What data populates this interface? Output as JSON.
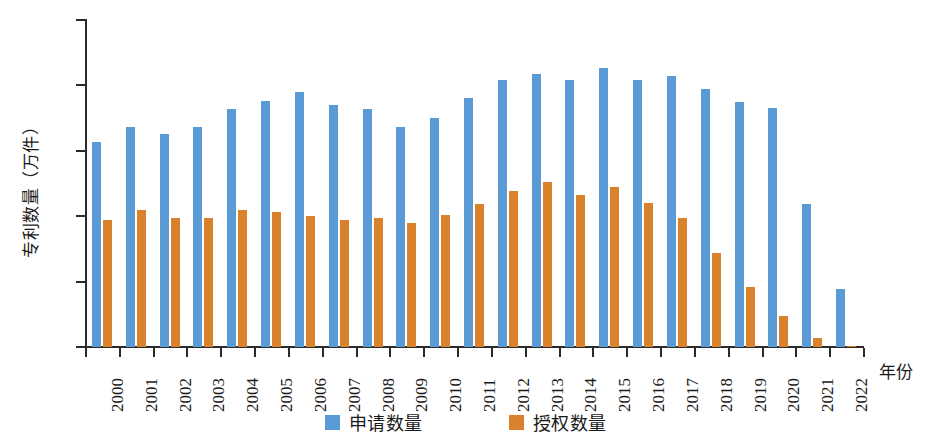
{
  "chart_data": {
    "type": "bar",
    "title": "",
    "xlabel": "年份",
    "ylabel": "专利数量（万件）",
    "categories": [
      "2000",
      "2001",
      "2002",
      "2003",
      "2004",
      "2005",
      "2006",
      "2007",
      "2008",
      "2009",
      "2010",
      "2011",
      "2012",
      "2013",
      "2014",
      "2015",
      "2016",
      "2017",
      "2018",
      "2019",
      "2020",
      "2021",
      "2022"
    ],
    "series": [
      {
        "name": "申请数量",
        "color": "#5b9bd5",
        "values": [
          1.57,
          1.68,
          1.63,
          1.68,
          1.82,
          1.88,
          1.95,
          1.85,
          1.82,
          1.68,
          1.75,
          1.9,
          2.04,
          2.09,
          2.04,
          2.13,
          2.04,
          2.07,
          1.97,
          1.87,
          1.83,
          1.09,
          0.44
        ]
      },
      {
        "name": "授权数量",
        "color": "#d9822b",
        "values": [
          0.97,
          1.05,
          0.99,
          0.99,
          1.05,
          1.03,
          1.0,
          0.97,
          0.99,
          0.95,
          1.01,
          1.09,
          1.19,
          1.26,
          1.16,
          1.22,
          1.1,
          0.99,
          0.72,
          0.46,
          0.24,
          0.07,
          0.01
        ]
      }
    ],
    "ylim": [
      0,
      2.5
    ],
    "yticks": [
      0,
      0.5,
      1.0,
      1.5,
      2.0,
      2.5
    ],
    "ytick_labels": [
      "0",
      "0.5",
      "1.0",
      "1.5",
      "2.0",
      "2.5"
    ],
    "grid": false,
    "legend_position": "bottom-center"
  },
  "legend": {
    "items": [
      {
        "label": "申请数量",
        "color": "#5b9bd5"
      },
      {
        "label": "授权数量",
        "color": "#d9822b"
      }
    ]
  },
  "axis": {
    "y_title": "专利数量（万件）",
    "x_title": "年份"
  }
}
